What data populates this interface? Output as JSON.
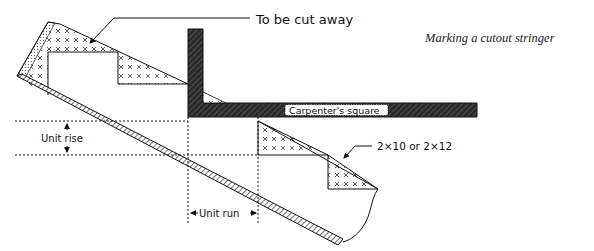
{
  "figure": {
    "caption": "Marking a cutout stringer"
  },
  "labels": {
    "cut_away": "To be cut away",
    "square": "Carpenter's square",
    "lumber": "2×10 or 2×12",
    "unit_rise": "Unit rise",
    "unit_run": "Unit run"
  },
  "colors": {
    "ink": "#111111",
    "square_fill": "#2a2a2a",
    "background": "#ffffff"
  }
}
